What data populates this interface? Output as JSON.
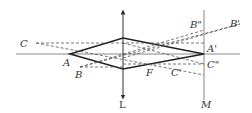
{
  "diagram": {
    "type": "optics-ray-diagram",
    "labels": {
      "A": "A",
      "A_prime": "A'",
      "B": "B",
      "B_prime": "B'",
      "B_double_prime": "B\"",
      "C": "C",
      "C_prime": "C'",
      "C_double_prime": "C\"",
      "F": "F",
      "L": "L",
      "M": "M"
    },
    "elements": [
      {
        "id": "optical-axis",
        "kind": "line",
        "style": "solid"
      },
      {
        "id": "lens-L",
        "kind": "double-arrow-vertical",
        "style": "solid"
      },
      {
        "id": "screen-M",
        "kind": "line-vertical",
        "style": "solid"
      },
      {
        "id": "rhombus-A-Aprime",
        "kind": "polygon",
        "style": "thick"
      },
      {
        "id": "rays",
        "kind": "dashed-lines",
        "style": "dashed"
      }
    ]
  }
}
